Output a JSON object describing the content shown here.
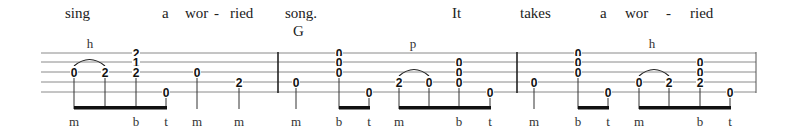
{
  "tab": {
    "staff": {
      "x_start": 41,
      "x_end": 756,
      "string_y": [
        53,
        62,
        72,
        82,
        92
      ],
      "line_color": "#8a8a8a",
      "barlines_x": [
        278,
        517,
        756
      ]
    },
    "lyrics": [
      {
        "text": "sing",
        "x": 65
      },
      {
        "text": "a",
        "x": 162
      },
      {
        "text": "wor",
        "x": 185
      },
      {
        "text": "-",
        "x": 214
      },
      {
        "text": "ried",
        "x": 230
      },
      {
        "text": "song.",
        "x": 285
      },
      {
        "text": "It",
        "x": 452
      },
      {
        "text": "takes",
        "x": 520
      },
      {
        "text": "a",
        "x": 600
      },
      {
        "text": "wor",
        "x": 625
      },
      {
        "text": "-",
        "x": 666
      },
      {
        "text": "ried",
        "x": 690
      }
    ],
    "chords": [
      {
        "text": "G",
        "x": 293
      }
    ],
    "techniques": [
      {
        "text": "h",
        "x": 90
      },
      {
        "text": "p",
        "x": 413
      },
      {
        "text": "h",
        "x": 652
      }
    ],
    "measures": [
      {
        "notes": [
          {
            "x": 74,
            "frets": [
              {
                "string": 3,
                "fret": "0"
              }
            ],
            "finger": "m"
          },
          {
            "x": 105,
            "frets": [
              {
                "string": 3,
                "fret": "2"
              }
            ],
            "finger": ""
          },
          {
            "x": 136,
            "frets": [
              {
                "string": 1,
                "fret": "2"
              },
              {
                "string": 2,
                "fret": "1"
              },
              {
                "string": 3,
                "fret": "2"
              }
            ],
            "finger": "b"
          },
          {
            "x": 166,
            "frets": [
              {
                "string": 5,
                "fret": "0"
              }
            ],
            "finger": "t"
          },
          {
            "x": 197,
            "frets": [
              {
                "string": 3,
                "fret": "0"
              }
            ],
            "finger": "m"
          },
          {
            "x": 239,
            "frets": [
              {
                "string": 4,
                "fret": "2"
              }
            ],
            "finger": "m"
          }
        ]
      },
      {
        "notes": [
          {
            "x": 296,
            "frets": [
              {
                "string": 4,
                "fret": "0"
              }
            ],
            "finger": "m"
          },
          {
            "x": 339,
            "frets": [
              {
                "string": 1,
                "fret": "0"
              },
              {
                "string": 2,
                "fret": "0"
              },
              {
                "string": 3,
                "fret": "0"
              }
            ],
            "finger": "b"
          },
          {
            "x": 369,
            "frets": [
              {
                "string": 5,
                "fret": "0"
              }
            ],
            "finger": "t"
          },
          {
            "x": 399,
            "frets": [
              {
                "string": 4,
                "fret": "2"
              }
            ],
            "finger": "m"
          },
          {
            "x": 429,
            "frets": [
              {
                "string": 4,
                "fret": "0"
              }
            ],
            "finger": ""
          },
          {
            "x": 459,
            "frets": [
              {
                "string": 2,
                "fret": "0"
              },
              {
                "string": 3,
                "fret": "0"
              },
              {
                "string": 4,
                "fret": "0"
              }
            ],
            "finger": "b"
          },
          {
            "x": 490,
            "frets": [
              {
                "string": 5,
                "fret": "0"
              }
            ],
            "finger": "t"
          }
        ]
      },
      {
        "notes": [
          {
            "x": 534,
            "frets": [
              {
                "string": 4,
                "fret": "0"
              }
            ],
            "finger": "m"
          },
          {
            "x": 578,
            "frets": [
              {
                "string": 1,
                "fret": "0"
              },
              {
                "string": 2,
                "fret": "0"
              },
              {
                "string": 3,
                "fret": "0"
              }
            ],
            "finger": "b"
          },
          {
            "x": 608,
            "frets": [
              {
                "string": 5,
                "fret": "0"
              }
            ],
            "finger": "t"
          },
          {
            "x": 639,
            "frets": [
              {
                "string": 4,
                "fret": "0"
              }
            ],
            "finger": "m"
          },
          {
            "x": 669,
            "frets": [
              {
                "string": 4,
                "fret": "2"
              }
            ],
            "finger": ""
          },
          {
            "x": 700,
            "frets": [
              {
                "string": 2,
                "fret": "0"
              },
              {
                "string": 3,
                "fret": "0"
              },
              {
                "string": 4,
                "fret": "2"
              }
            ],
            "finger": "b"
          },
          {
            "x": 730,
            "frets": [
              {
                "string": 5,
                "fret": "0"
              }
            ],
            "finger": "t"
          }
        ]
      }
    ],
    "beams": [
      {
        "x1": 74,
        "x2": 166
      },
      {
        "x1": 339,
        "x2": 369
      },
      {
        "x1": 399,
        "x2": 490
      },
      {
        "x1": 578,
        "x2": 608
      },
      {
        "x1": 639,
        "x2": 730
      }
    ],
    "slurs": [
      {
        "x1": 74,
        "x2": 105,
        "string": 3
      },
      {
        "x1": 399,
        "x2": 429,
        "string": 4
      },
      {
        "x1": 639,
        "x2": 669,
        "string": 4
      }
    ],
    "stem_bottom_y": 109,
    "finger_label_y": 126,
    "lyric_y": 18,
    "chord_y": 36,
    "technique_y": 48
  }
}
